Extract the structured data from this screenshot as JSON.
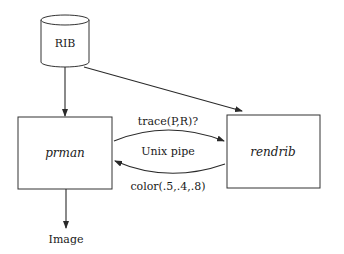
{
  "diagram": {
    "type": "dataflow",
    "nodes": [
      {
        "id": "rib",
        "label": "RIB",
        "shape": "cylinder"
      },
      {
        "id": "prman",
        "label": "prman",
        "shape": "rectangle",
        "italic": true
      },
      {
        "id": "rendrib",
        "label": "rendrib",
        "shape": "rectangle",
        "italic": true
      },
      {
        "id": "image",
        "label": "Image",
        "shape": "text"
      }
    ],
    "edges": [
      {
        "from": "rib",
        "to": "prman",
        "label": ""
      },
      {
        "from": "rib",
        "to": "rendrib",
        "label": ""
      },
      {
        "from": "prman",
        "to": "rendrib",
        "label": "trace(P,R)?"
      },
      {
        "from": "rendrib",
        "to": "prman",
        "label": "color(.5,.4,.8)"
      },
      {
        "from": "prman",
        "to": "image",
        "label": ""
      }
    ],
    "channel_label": "Unix pipe"
  },
  "labels": {
    "rib": "RIB",
    "prman": "prman",
    "rendrib": "rendrib",
    "image": "Image",
    "request": "trace(P,R)?",
    "pipe": "Unix pipe",
    "response": "color(.5,.4,.8)"
  },
  "colors": {
    "line": "#2a2a2a",
    "text": "#1a1a1a",
    "background": "#ffffff"
  }
}
